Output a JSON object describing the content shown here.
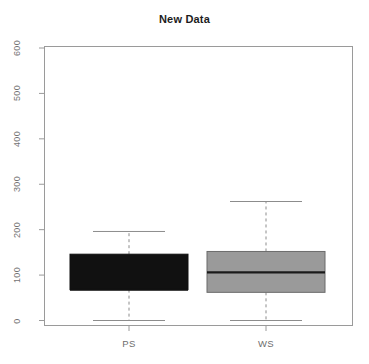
{
  "chart_data": {
    "type": "box",
    "title": "New Data",
    "xlabel": "",
    "ylabel": "",
    "categories": [
      "PS",
      "WS"
    ],
    "ylim": [
      0,
      600
    ],
    "yticks": [
      0,
      100,
      200,
      300,
      400,
      500,
      600
    ],
    "ytick_labels": [
      "0",
      "100",
      "200",
      "300",
      "400",
      "500",
      "600"
    ],
    "grid": false,
    "legend": false,
    "y_axis_label_rotation": -90,
    "boxes": [
      {
        "name": "PS",
        "whisker_low": 0,
        "q1": 68,
        "median": 68,
        "q3": 146,
        "whisker_high": 196,
        "outliers": [],
        "fill_color": "#111111",
        "median_color": "#111111",
        "border_color": "#111111"
      },
      {
        "name": "WS",
        "whisker_low": 0,
        "q1": 62,
        "median": 106,
        "q3": 152,
        "whisker_high": 262,
        "outliers": [],
        "fill_color": "#9a9a9a",
        "median_color": "#1a1a1a",
        "border_color": "#6b6b6b"
      }
    ],
    "axis_color": "#9a9a9a",
    "whisker_color": "#8c8c8c",
    "title_color": "#1c1c1c",
    "background_color": "#ffffff"
  }
}
